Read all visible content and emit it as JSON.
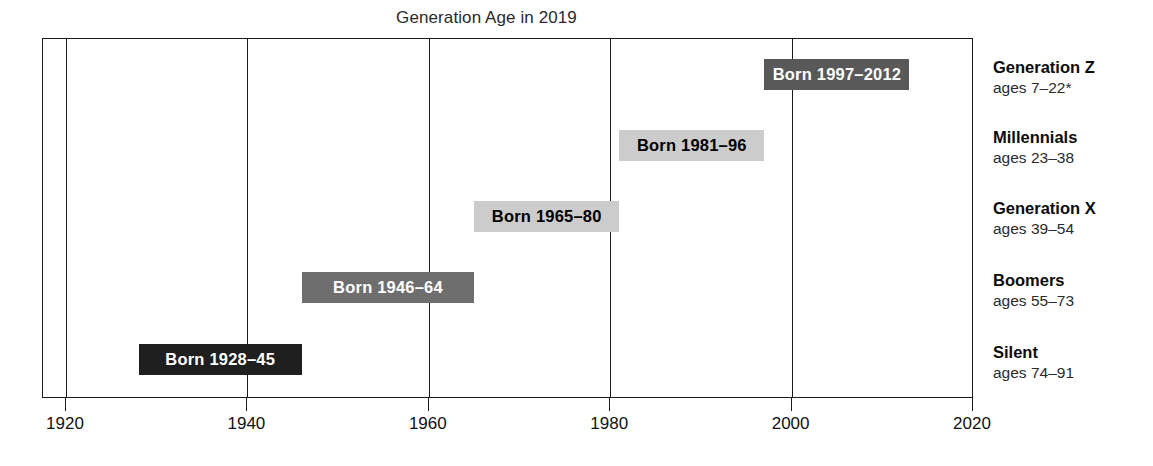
{
  "chart_data": {
    "type": "bar",
    "title": "Generation Age in 2019",
    "xlabel": "",
    "ylabel": "",
    "xlim": [
      1920,
      2020
    ],
    "xticks": [
      1920,
      1940,
      1960,
      1980,
      2000,
      2020
    ],
    "xtick_labels": [
      "1920",
      "1940",
      "1960",
      "1980",
      "2000",
      "2020"
    ],
    "grid": true,
    "legend_position": "right",
    "orientation": "horizontal-range",
    "categories": [
      "Generation Z",
      "Millennials",
      "Generation X",
      "Boomers",
      "Silent"
    ],
    "series": [
      {
        "name": "birth-year range",
        "values": [
          {
            "category": "Generation Z",
            "start": 1997,
            "end": 2012,
            "label": "Born 1997–2012",
            "ages": "ages 7–22*",
            "bar_color": "#595959",
            "text_color": "#ffffff"
          },
          {
            "category": "Millennials",
            "start": 1981,
            "end": 1996,
            "label": "Born 1981–96",
            "ages": "ages 23–38",
            "bar_color": "#cccccc",
            "text_color": "#000000"
          },
          {
            "category": "Generation X",
            "start": 1965,
            "end": 1980,
            "label": "Born 1965–80",
            "ages": "ages 39–54",
            "bar_color": "#cccccc",
            "text_color": "#000000"
          },
          {
            "category": "Boomers",
            "start": 1946,
            "end": 1964,
            "label": "Born 1946–64",
            "ages": "ages 55–73",
            "bar_color": "#6e6e6e",
            "text_color": "#ffffff"
          },
          {
            "category": "Silent",
            "start": 1928,
            "end": 1945,
            "label": "Born 1928–45",
            "ages": "ages 74–91",
            "bar_color": "#1f1f1f",
            "text_color": "#ffffff"
          }
        ]
      }
    ],
    "annotations": [
      "* ages 7–22 denotes partial generation still being born"
    ],
    "axis_color": "#1a1a1a"
  },
  "bars": [
    {
      "label": "Born 1997–2012",
      "ages": "ages 7–22*",
      "name": "Generation Z"
    },
    {
      "label": "Born 1981–96",
      "ages": "ages 23–38",
      "name": "Millennials"
    },
    {
      "label": "Born 1965–80",
      "ages": "ages 39–54",
      "name": "Generation X"
    },
    {
      "label": "Born 1946–64",
      "ages": "ages 55–73",
      "name": "Boomers"
    },
    {
      "label": "Born 1928–45",
      "ages": "ages 74–91",
      "name": "Silent"
    }
  ],
  "ticks": [
    {
      "label": "1920"
    },
    {
      "label": "1940"
    },
    {
      "label": "1960"
    },
    {
      "label": "1980"
    },
    {
      "label": "2000"
    },
    {
      "label": "2020"
    }
  ]
}
